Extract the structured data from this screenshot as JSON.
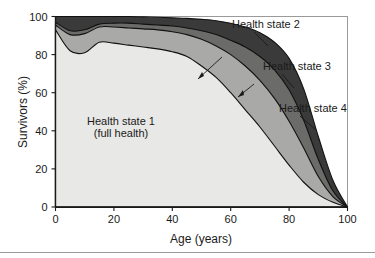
{
  "chart_data": {
    "type": "area",
    "title": "",
    "subtitle": "",
    "xlabel": "Age (years)",
    "ylabel": "Survivors (%)",
    "xlim": [
      0,
      100
    ],
    "ylim": [
      0,
      100
    ],
    "xticks": [
      0,
      20,
      40,
      60,
      80,
      100
    ],
    "yticks": [
      0,
      20,
      40,
      60,
      80,
      100
    ],
    "xtick_labels": [
      "0",
      "20",
      "40",
      "60",
      "80",
      "100"
    ],
    "ytick_labels": [
      "0",
      "20",
      "40",
      "60",
      "80",
      "100"
    ],
    "grid": false,
    "legend_position": "inline-annotations",
    "stacked": true,
    "stack_order": "cumulative-from-bottom",
    "x": [
      0,
      5,
      10,
      15,
      20,
      25,
      30,
      35,
      40,
      45,
      50,
      55,
      60,
      65,
      70,
      75,
      80,
      85,
      90,
      95,
      100
    ],
    "series": [
      {
        "name": "Health state 1 (full health)",
        "label": "Health state 1",
        "color": "#e8e8e6",
        "cumulative_values": [
          93,
          82,
          81,
          86.5,
          86,
          85,
          84,
          83,
          81.5,
          79,
          74,
          68,
          60,
          51,
          42,
          32,
          22,
          13,
          6.5,
          2.5,
          0
        ],
        "values": [
          93,
          82,
          81,
          86.5,
          86,
          85,
          84,
          83,
          81.5,
          79,
          74,
          68,
          60,
          51,
          42,
          32,
          22,
          13,
          6.5,
          2.5,
          0
        ]
      },
      {
        "name": "Health state 2",
        "label": "Health state 2",
        "color": "#a9a9a7",
        "cumulative_values": [
          95.5,
          90.5,
          91,
          94.5,
          94.5,
          94,
          93.5,
          93,
          92,
          90.5,
          88,
          84.5,
          80,
          74,
          66.5,
          57,
          45,
          31,
          16,
          5.5,
          0
        ],
        "values": [
          2.5,
          8.5,
          10,
          8,
          8.5,
          9,
          9.5,
          10,
          10.5,
          11.5,
          14,
          16.5,
          20,
          23,
          24.5,
          25,
          23,
          18,
          9.5,
          3,
          0
        ]
      },
      {
        "name": "Health state 3",
        "label": "Health state 3",
        "color": "#6b6b69",
        "cumulative_values": [
          97,
          92.5,
          93,
          96,
          96.5,
          96.5,
          96,
          95.5,
          95,
          94,
          92.5,
          90.5,
          87.5,
          84,
          79,
          72,
          61.5,
          45.5,
          25,
          8.5,
          0
        ],
        "values": [
          1.5,
          2,
          2,
          1.5,
          2,
          2.5,
          2.5,
          2.5,
          3,
          3.5,
          4.5,
          6,
          7.5,
          10,
          12.5,
          15,
          16.5,
          14.5,
          9,
          3,
          0
        ]
      },
      {
        "name": "Health state 4",
        "label": "Health state 4",
        "color": "#3a3a3a",
        "cumulative_values": [
          100,
          100,
          100,
          100,
          100,
          100,
          99.8,
          99.6,
          99.3,
          99,
          98.5,
          97.8,
          96.5,
          94.5,
          91.5,
          86.5,
          78,
          62,
          37,
          14,
          0
        ],
        "values": [
          3,
          7.5,
          7,
          4,
          3.5,
          3.5,
          3.8,
          4.1,
          4.3,
          5,
          6,
          7.3,
          9,
          10.5,
          12.5,
          14.5,
          16.5,
          16.5,
          12,
          5.5,
          0
        ]
      }
    ],
    "annotations": [
      {
        "text": "Health state 2",
        "name": "health-state-2-label",
        "has_leader": true
      },
      {
        "text": "Health state 3",
        "name": "health-state-3-label",
        "has_leader": true
      },
      {
        "text": "Health state 4",
        "name": "health-state-4-label",
        "has_leader": true
      },
      {
        "text": "Health state 1",
        "name": "health-state-1-label-line1",
        "has_leader": false
      },
      {
        "text": "(full health)",
        "name": "health-state-1-label-line2",
        "has_leader": false
      }
    ]
  },
  "labels": {
    "ylabel": "Survivors (%)",
    "xlabel": "Age (years)",
    "state1_line1": "Health state 1",
    "state1_line2": "(full health)",
    "state2": "Health state 2",
    "state3": "Health state 3",
    "state4": "Health state 4"
  },
  "ticks": {
    "x": [
      "0",
      "20",
      "40",
      "60",
      "80",
      "100"
    ],
    "y": [
      "0",
      "20",
      "40",
      "60",
      "80",
      "100"
    ]
  },
  "colors": {
    "state1": "#e8e8e6",
    "state2": "#a9a9a7",
    "state3": "#6b6b69",
    "state4": "#3a3a3a",
    "outline": "#111111",
    "frame": "#9a9a9a",
    "axis": "#1a1a1a",
    "background": "#ffffff"
  }
}
